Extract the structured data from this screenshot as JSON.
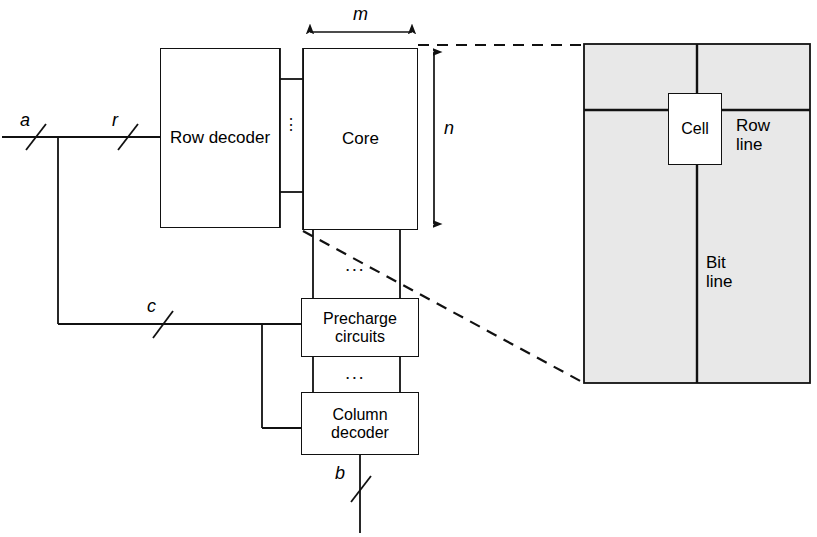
{
  "diagram": {
    "blocks": [
      {
        "id": "row-decoder",
        "label": "Row\ndecoder"
      },
      {
        "id": "core",
        "label": "Core"
      },
      {
        "id": "precharge",
        "label": "Precharge\ncircuits"
      },
      {
        "id": "column-decoder",
        "label": "Column\ndecoder"
      }
    ],
    "signals": [
      {
        "id": "a",
        "label": "a"
      },
      {
        "id": "r",
        "label": "r"
      },
      {
        "id": "c",
        "label": "c"
      },
      {
        "id": "b",
        "label": "b"
      }
    ],
    "dimensions": [
      {
        "id": "m",
        "label": "m",
        "orientation": "horizontal"
      },
      {
        "id": "n",
        "label": "n",
        "orientation": "vertical"
      }
    ],
    "ellipsis": {
      "row_core": "⋮",
      "core_precharge": "...",
      "precharge_column": "..."
    },
    "detail": {
      "cell_label": "Cell",
      "row_line_label": "Row\nline",
      "bit_line_label": "Bit\nline",
      "fill_color": "#e8e8e8"
    },
    "colors": {
      "stroke": "#111111",
      "background": "#ffffff",
      "panel_fill": "#e8e8e8"
    }
  }
}
